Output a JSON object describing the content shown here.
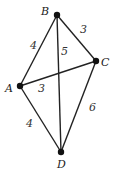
{
  "graph": {
    "vertices": [
      {
        "id": "A",
        "label": "A",
        "x": 20,
        "y": 86,
        "lx": 5,
        "ly": 92
      },
      {
        "id": "B",
        "label": "B",
        "x": 57,
        "y": 15,
        "lx": 41,
        "ly": 15
      },
      {
        "id": "C",
        "label": "C",
        "x": 96,
        "y": 61,
        "lx": 101,
        "ly": 66
      },
      {
        "id": "D",
        "label": "D",
        "x": 61,
        "y": 152,
        "lx": 57,
        "ly": 168
      }
    ],
    "edges": [
      {
        "from": "A",
        "to": "B",
        "weight": "4",
        "lx": 30,
        "ly": 49
      },
      {
        "from": "B",
        "to": "C",
        "weight": "3",
        "lx": 80,
        "ly": 33
      },
      {
        "from": "B",
        "to": "D",
        "weight": "5",
        "lx": 61,
        "ly": 55
      },
      {
        "from": "A",
        "to": "C",
        "weight": "3",
        "lx": 38,
        "ly": 92
      },
      {
        "from": "A",
        "to": "D",
        "weight": "4",
        "lx": 26,
        "ly": 127
      },
      {
        "from": "C",
        "to": "D",
        "weight": "6",
        "lx": 89,
        "ly": 111
      }
    ]
  }
}
